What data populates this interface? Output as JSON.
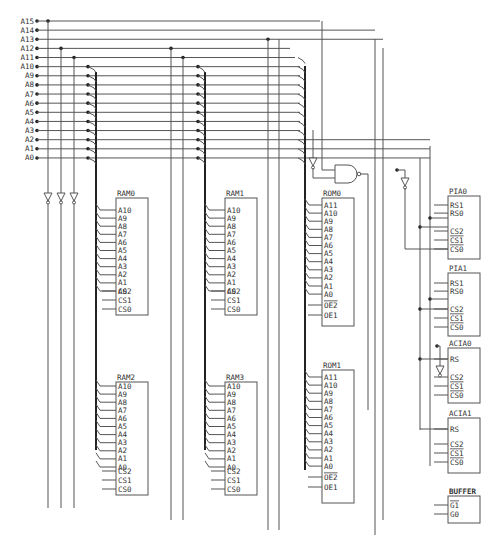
{
  "diagram": {
    "type": "schematic",
    "address_lines": [
      "A15",
      "A14",
      "A13",
      "A12",
      "A11",
      "A10",
      "A9",
      "A8",
      "A7",
      "A6",
      "A5",
      "A4",
      "A3",
      "A2",
      "A1",
      "A0"
    ],
    "chips": [
      {
        "id": "ram0",
        "title": "RAM0",
        "pins": [
          "A10",
          "A9",
          "A8",
          "A7",
          "A6",
          "A5",
          "A4",
          "A3",
          "A2",
          "A1",
          "A0"
        ],
        "ctrl": [
          "CS2",
          "CS1",
          "CS0"
        ]
      },
      {
        "id": "ram1",
        "title": "RAM1",
        "pins": [
          "A10",
          "A9",
          "A8",
          "A7",
          "A6",
          "A5",
          "A4",
          "A3",
          "A2",
          "A1",
          "A0"
        ],
        "ctrl": [
          "CS2",
          "CS1",
          "CS0"
        ]
      },
      {
        "id": "ram2",
        "title": "RAM2",
        "pins": [
          "A10",
          "A9",
          "A8",
          "A7",
          "A6",
          "A5",
          "A4",
          "A3",
          "A2",
          "A1",
          "A0"
        ],
        "ctrl": [
          "CS2",
          "CS1",
          "CS0"
        ]
      },
      {
        "id": "ram3",
        "title": "RAM3",
        "pins": [
          "A10",
          "A9",
          "A8",
          "A7",
          "A6",
          "A5",
          "A4",
          "A3",
          "A2",
          "A1",
          "A0"
        ],
        "ctrl": [
          "CS2",
          "CS1",
          "CS0"
        ]
      },
      {
        "id": "rom0",
        "title": "ROM0",
        "pins": [
          "A11",
          "A10",
          "A9",
          "A8",
          "A7",
          "A6",
          "A5",
          "A4",
          "A3",
          "A2",
          "A1",
          "A0"
        ],
        "ctrl": [
          "OE2",
          "OE1"
        ]
      },
      {
        "id": "rom1",
        "title": "ROM1",
        "pins": [
          "A11",
          "A10",
          "A9",
          "A8",
          "A7",
          "A6",
          "A5",
          "A4",
          "A3",
          "A2",
          "A1",
          "A0"
        ],
        "ctrl": [
          "OE2",
          "OE1"
        ]
      },
      {
        "id": "pia0",
        "title": "PIA0",
        "pins": [
          "RS1",
          "RS0"
        ],
        "ctrl": [
          "CS2",
          "CS1",
          "CS0"
        ]
      },
      {
        "id": "pia1",
        "title": "PIA1",
        "pins": [
          "RS1",
          "RS0"
        ],
        "ctrl": [
          "CS2",
          "CS1",
          "CS0"
        ]
      },
      {
        "id": "acia0",
        "title": "ACIA0",
        "pins": [
          "RS"
        ],
        "ctrl": [
          "CS2",
          "CS1",
          "CS0"
        ]
      },
      {
        "id": "acia1",
        "title": "ACIA1",
        "pins": [
          "RS"
        ],
        "ctrl": [
          "CS2",
          "CS1",
          "CS0"
        ]
      },
      {
        "id": "buffer",
        "title": "BUFFER",
        "pins": [],
        "ctrl": [
          "G1",
          "G0"
        ]
      }
    ]
  }
}
